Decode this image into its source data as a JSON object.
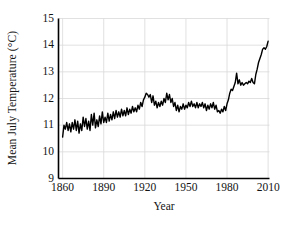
{
  "chart_data": {
    "type": "line",
    "title": "",
    "xlabel": "Year",
    "ylabel": "Mean July Temperature (°C)",
    "xlim": [
      1857,
      2011
    ],
    "ylim": [
      9,
      15
    ],
    "xticks": [
      1860,
      1890,
      1920,
      1950,
      1980,
      2010
    ],
    "xtick_labels": [
      "1860",
      "1890",
      "1920",
      "1950",
      "1980",
      "2010"
    ],
    "yticks": [
      9,
      10,
      11,
      12,
      13,
      14,
      15
    ],
    "ytick_labels": [
      "9",
      "10",
      "11",
      "12",
      "13",
      "14",
      "15"
    ],
    "grid": true,
    "grid_color": "#d9d9d9",
    "legend": null,
    "series": [
      {
        "name": "Mean July Temperature",
        "color": "#000000",
        "line_width": 1.4,
        "x": [
          1860,
          1861,
          1862,
          1863,
          1864,
          1865,
          1866,
          1867,
          1868,
          1869,
          1870,
          1871,
          1872,
          1873,
          1874,
          1875,
          1876,
          1877,
          1878,
          1879,
          1880,
          1881,
          1882,
          1883,
          1884,
          1885,
          1886,
          1887,
          1888,
          1889,
          1890,
          1891,
          1892,
          1893,
          1894,
          1895,
          1896,
          1897,
          1898,
          1899,
          1900,
          1901,
          1902,
          1903,
          1904,
          1905,
          1906,
          1907,
          1908,
          1909,
          1910,
          1911,
          1912,
          1913,
          1914,
          1915,
          1916,
          1917,
          1918,
          1919,
          1920,
          1921,
          1922,
          1923,
          1924,
          1925,
          1926,
          1927,
          1928,
          1929,
          1930,
          1931,
          1932,
          1933,
          1934,
          1935,
          1936,
          1937,
          1938,
          1939,
          1940,
          1941,
          1942,
          1943,
          1944,
          1945,
          1946,
          1947,
          1948,
          1949,
          1950,
          1951,
          1952,
          1953,
          1954,
          1955,
          1956,
          1957,
          1958,
          1959,
          1960,
          1961,
          1962,
          1963,
          1964,
          1965,
          1966,
          1967,
          1968,
          1969,
          1970,
          1971,
          1972,
          1973,
          1974,
          1975,
          1976,
          1977,
          1978,
          1979,
          1980,
          1981,
          1982,
          1983,
          1984,
          1985,
          1986,
          1987,
          1988,
          1989,
          1990,
          1991,
          1992,
          1993,
          1994,
          1995,
          1996,
          1997,
          1998,
          1999,
          2000,
          2001,
          2002,
          2003,
          2004,
          2005,
          2006,
          2007,
          2008,
          2009,
          2010
        ],
        "y": [
          10.55,
          11.0,
          10.85,
          11.1,
          10.8,
          11.05,
          10.75,
          11.1,
          10.85,
          11.2,
          10.8,
          11.15,
          10.7,
          11.05,
          10.8,
          11.3,
          10.95,
          11.25,
          10.85,
          11.15,
          10.8,
          11.4,
          11.0,
          11.45,
          10.9,
          11.2,
          10.95,
          11.35,
          11.05,
          11.5,
          11.1,
          11.3,
          11.1,
          11.45,
          11.15,
          11.4,
          11.2,
          11.5,
          11.25,
          11.55,
          11.3,
          11.5,
          11.3,
          11.6,
          11.35,
          11.55,
          11.35,
          11.65,
          11.4,
          11.6,
          11.45,
          11.7,
          11.5,
          11.65,
          11.5,
          11.75,
          11.6,
          11.85,
          11.7,
          11.95,
          12.05,
          12.2,
          12.15,
          12.05,
          12.15,
          11.85,
          12.1,
          11.75,
          11.9,
          11.65,
          11.85,
          11.7,
          11.9,
          11.75,
          12.0,
          11.85,
          12.2,
          11.95,
          12.15,
          11.85,
          12.0,
          11.7,
          11.85,
          11.55,
          11.75,
          11.5,
          11.7,
          11.6,
          11.8,
          11.6,
          11.75,
          11.65,
          11.85,
          11.7,
          11.9,
          11.7,
          11.8,
          11.65,
          11.85,
          11.65,
          11.8,
          11.7,
          11.85,
          11.65,
          11.8,
          11.55,
          11.75,
          11.6,
          11.8,
          11.65,
          11.85,
          11.6,
          11.75,
          11.5,
          11.55,
          11.45,
          11.6,
          11.5,
          11.7,
          11.55,
          11.8,
          11.95,
          12.2,
          12.35,
          12.3,
          12.45,
          12.6,
          12.95,
          12.55,
          12.7,
          12.5,
          12.6,
          12.5,
          12.55,
          12.6,
          12.55,
          12.65,
          12.6,
          12.75,
          12.6,
          12.55,
          12.9,
          13.1,
          13.35,
          13.5,
          13.65,
          13.85,
          13.9,
          13.85,
          13.95,
          14.15
        ]
      }
    ]
  },
  "axes": {
    "frame_color": "#000000",
    "background": "#ffffff"
  }
}
